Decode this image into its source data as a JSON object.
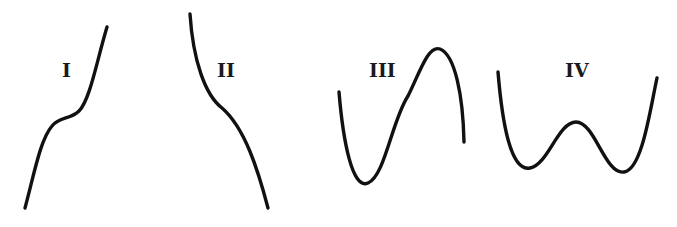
{
  "figure": {
    "colors": {
      "background": "#ffffff",
      "stroke": "#111111"
    },
    "panels": [
      {
        "label": "I",
        "shape": "increasing curve with a flat inflection plateau",
        "label_pos": [
          70,
          76
        ],
        "path": "M 25 208 C 34 175, 40 140, 52 126 C 60 116, 70 120, 79 111 C 90 100, 97 60, 107 27"
      },
      {
        "label": "II",
        "shape": "decreasing curve with inflection point",
        "label_pos": [
          228,
          76
        ],
        "path": "M 190 14 C 193 60, 205 95, 222 108 C 245 128, 258 170, 268 208"
      },
      {
        "label": "III",
        "shape": "cubic-like curve: local minimum then local maximum",
        "label_pos": [
          385,
          76
        ],
        "path": "M 339 92 C 343 140, 352 190, 368 183 C 385 176, 392 120, 408 96 C 420 72, 428 45, 440 49 C 455 55, 463 95, 464 142"
      },
      {
        "label": "IV",
        "shape": "W-shaped quartic: two minima and one local maximum",
        "label_pos": [
          578,
          76
        ],
        "path": "M 498 72 C 502 120, 510 172, 530 168 C 548 165, 558 122, 576 122 C 595 122, 605 175, 624 172 C 642 170, 650 110, 657 78"
      }
    ]
  }
}
